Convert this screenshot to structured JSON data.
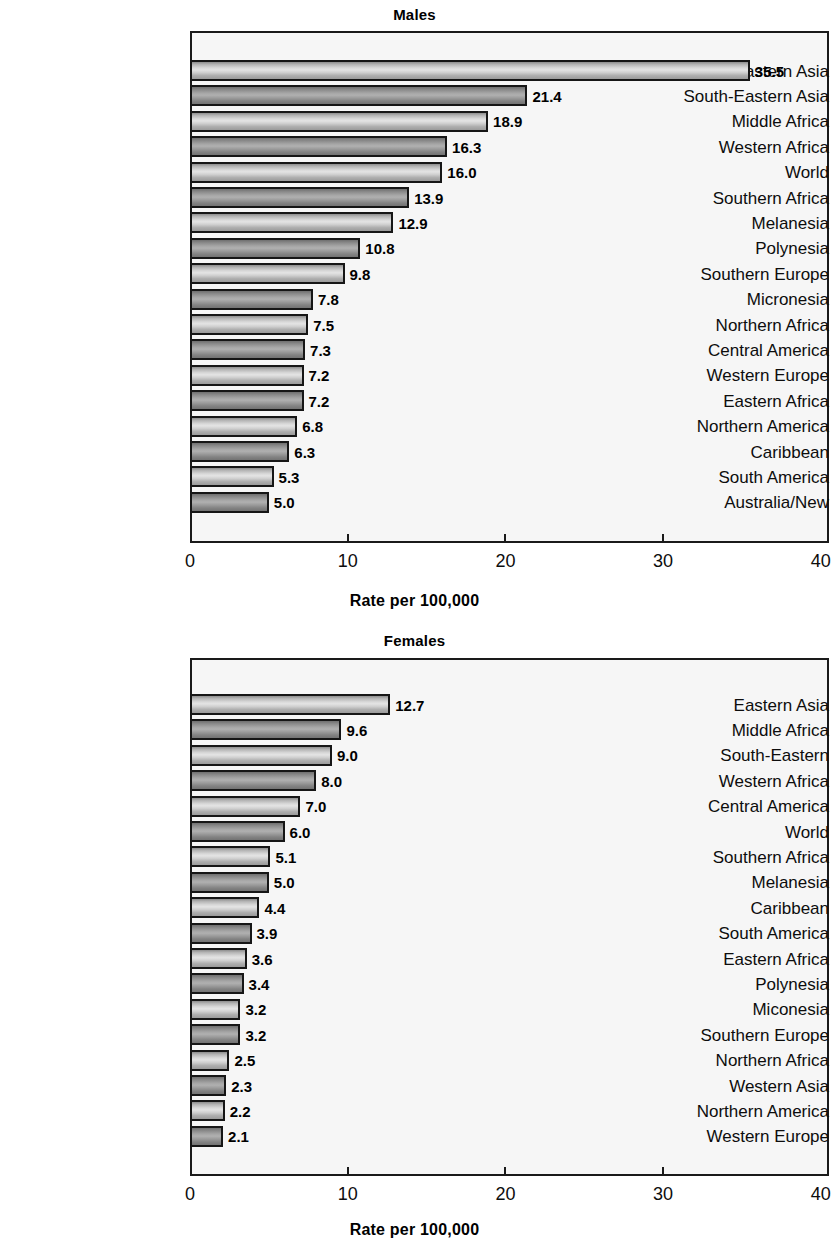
{
  "figure": {
    "background": "#ffffff",
    "plot_background": "#f6f6f6",
    "border_color": "#1a1a1a"
  },
  "chart_data": [
    {
      "type": "bar",
      "orientation": "horizontal",
      "title": "Males",
      "xlabel": "Rate per 100,000",
      "ylabel": "",
      "xlim": [
        0,
        40
      ],
      "xticks": [
        0,
        10,
        20,
        30,
        40
      ],
      "xtick_labels": [
        "0",
        "10",
        "20",
        "30",
        "40"
      ],
      "grid": false,
      "legend": null,
      "categories": [
        "Eastern Asia",
        "South-Eastern Asia",
        "Middle Africa",
        "Western Africa",
        "World",
        "Southern Africa",
        "Melanesia",
        "Polynesia",
        "Southern Europe",
        "Micronesia",
        "Northern Africa",
        "Central America",
        "Western Europe",
        "Eastern Africa",
        "Northern America",
        "Caribbean",
        "South America",
        "Australia/New"
      ],
      "values": [
        35.5,
        21.4,
        18.9,
        16.3,
        16.0,
        13.9,
        12.9,
        10.8,
        9.8,
        7.8,
        7.5,
        7.3,
        7.2,
        7.2,
        6.8,
        6.3,
        5.3,
        5.0
      ],
      "value_labels": [
        "35.5",
        "21.4",
        "18.9",
        "16.3",
        "16.0",
        "13.9",
        "12.9",
        "10.8",
        "9.8",
        "7.8",
        "7.5",
        "7.3",
        "7.2",
        "7.2",
        "6.8",
        "6.3",
        "5.3",
        "5.0"
      ]
    },
    {
      "type": "bar",
      "orientation": "horizontal",
      "title": "Females",
      "xlabel": "Rate per 100,000",
      "ylabel": "",
      "xlim": [
        0,
        40
      ],
      "xticks": [
        0,
        10,
        20,
        30,
        40
      ],
      "xtick_labels": [
        "0",
        "10",
        "20",
        "30",
        "40"
      ],
      "grid": false,
      "legend": null,
      "categories": [
        "Eastern Asia",
        "Middle Africa",
        "South-Eastern",
        "Western Africa",
        "Central America",
        "World",
        "Southern Africa",
        "Melanesia",
        "Caribbean",
        "South America",
        "Eastern Africa",
        "Polynesia",
        "Miconesia",
        "Southern Europe",
        "Northern Africa",
        "Western Asia",
        "Northern America",
        "Western Europe"
      ],
      "values": [
        12.7,
        9.6,
        9.0,
        8.0,
        7.0,
        6.0,
        5.1,
        5.0,
        4.4,
        3.9,
        3.6,
        3.4,
        3.2,
        3.2,
        2.5,
        2.3,
        2.2,
        2.1
      ],
      "value_labels": [
        "12.7",
        "9.6",
        "9.0",
        "8.0",
        "7.0",
        "6.0",
        "5.1",
        "5.0",
        "4.4",
        "3.9",
        "3.6",
        "3.4",
        "3.2",
        "3.2",
        "2.5",
        "2.3",
        "2.2",
        "2.1"
      ]
    }
  ]
}
